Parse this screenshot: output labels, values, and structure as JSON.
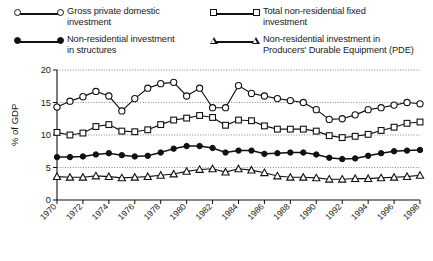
{
  "legend": {
    "entries": [
      {
        "label": "Gross private domestic\ninvestment",
        "marker": "circle-open",
        "name": "legend-gross-private-domestic-investment"
      },
      {
        "label": "Total non-residential fixed\ninvestment",
        "marker": "square-open",
        "name": "legend-total-nonresidential-fixed-investment"
      },
      {
        "label": "Non-residential investment\nin structures",
        "marker": "circle-filled",
        "name": "legend-nonresidential-investment-structures"
      },
      {
        "label": "Non-residential investment in\nProducers' Durable Equipment (PDE)",
        "marker": "triangle-open",
        "name": "legend-nonresidential-investment-pde"
      }
    ]
  },
  "chart_data": {
    "type": "line",
    "title": "",
    "xlabel": "Year",
    "ylabel": "% of GDP",
    "xlim": [
      1970,
      1998
    ],
    "ylim": [
      0,
      20
    ],
    "yticks": [
      0,
      5,
      10,
      15,
      20
    ],
    "xticks": [
      1970,
      1972,
      1974,
      1976,
      1978,
      1980,
      1982,
      1984,
      1986,
      1988,
      1990,
      1992,
      1994,
      1996,
      1998
    ],
    "xtick_labels": [
      "1970",
      "1972",
      "1974",
      "1976",
      "1978",
      "1980",
      "1982",
      "1984",
      "1986",
      "1988",
      "1990",
      "1992",
      "1994",
      "1996",
      "1998"
    ],
    "ytick_labels": [
      "0",
      "5",
      "10",
      "15",
      "20"
    ],
    "grid": "horizontal-dotted",
    "legend_position": "above-plot",
    "x": [
      1970,
      1971,
      1972,
      1973,
      1974,
      1975,
      1976,
      1977,
      1978,
      1979,
      1980,
      1981,
      1982,
      1983,
      1984,
      1985,
      1986,
      1987,
      1988,
      1989,
      1990,
      1991,
      1992,
      1993,
      1994,
      1995,
      1996,
      1997,
      1998
    ],
    "series": [
      {
        "name": "Gross private domestic investment",
        "marker": "circle-open",
        "values": [
          14.3,
          15.2,
          15.9,
          16.7,
          16.0,
          13.7,
          15.6,
          17.2,
          17.9,
          18.1,
          16.0,
          17.2,
          14.2,
          14.2,
          17.6,
          16.4,
          16.0,
          15.6,
          15.3,
          15.0,
          13.9,
          12.4,
          12.5,
          13.1,
          13.9,
          14.2,
          14.6,
          15.0,
          14.8
        ]
      },
      {
        "name": "Total non-residential fixed investment",
        "marker": "square-open",
        "values": [
          10.4,
          10.0,
          10.3,
          11.3,
          11.6,
          10.6,
          10.5,
          10.8,
          11.6,
          12.3,
          12.6,
          13.0,
          12.7,
          11.5,
          12.3,
          12.2,
          11.4,
          10.9,
          10.9,
          10.9,
          10.6,
          9.9,
          9.6,
          9.8,
          10.1,
          10.7,
          11.2,
          11.8,
          12.0
        ]
      },
      {
        "name": "Non-residential investment in structures",
        "marker": "circle-filled",
        "values": [
          6.6,
          6.6,
          6.7,
          7.0,
          7.2,
          6.9,
          6.7,
          6.8,
          7.3,
          7.9,
          8.3,
          8.3,
          8.0,
          7.3,
          7.6,
          7.6,
          7.1,
          7.2,
          7.3,
          7.3,
          7.0,
          6.5,
          6.3,
          6.4,
          6.8,
          7.2,
          7.5,
          7.6,
          7.7
        ]
      },
      {
        "name": "Non-residential investment in Producers' Durable Equipment (PDE)",
        "marker": "triangle-open",
        "values": [
          3.6,
          3.5,
          3.5,
          3.7,
          3.6,
          3.4,
          3.5,
          3.6,
          3.8,
          4.0,
          4.4,
          4.7,
          4.8,
          4.3,
          4.8,
          4.6,
          4.2,
          3.7,
          3.5,
          3.5,
          3.4,
          3.2,
          3.2,
          3.3,
          3.3,
          3.4,
          3.5,
          3.6,
          3.8
        ]
      }
    ]
  }
}
